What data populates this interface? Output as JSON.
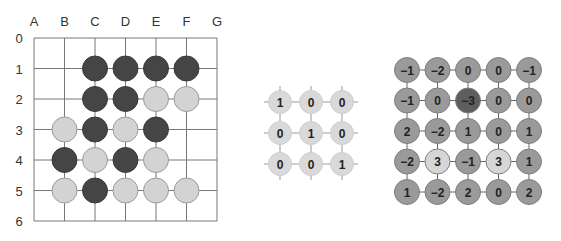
{
  "board": {
    "col_labels": [
      "A",
      "B",
      "C",
      "D",
      "E",
      "F",
      "G"
    ],
    "row_labels": [
      "0",
      "1",
      "2",
      "3",
      "4",
      "5",
      "6"
    ],
    "stones": [
      {
        "col": "C",
        "row": 1,
        "color": "black"
      },
      {
        "col": "D",
        "row": 1,
        "color": "black"
      },
      {
        "col": "E",
        "row": 1,
        "color": "black"
      },
      {
        "col": "F",
        "row": 1,
        "color": "black"
      },
      {
        "col": "C",
        "row": 2,
        "color": "black"
      },
      {
        "col": "D",
        "row": 2,
        "color": "black"
      },
      {
        "col": "E",
        "row": 2,
        "color": "white"
      },
      {
        "col": "F",
        "row": 2,
        "color": "white"
      },
      {
        "col": "B",
        "row": 3,
        "color": "white"
      },
      {
        "col": "C",
        "row": 3,
        "color": "black"
      },
      {
        "col": "D",
        "row": 3,
        "color": "white"
      },
      {
        "col": "E",
        "row": 3,
        "color": "black"
      },
      {
        "col": "B",
        "row": 4,
        "color": "black"
      },
      {
        "col": "C",
        "row": 4,
        "color": "white"
      },
      {
        "col": "D",
        "row": 4,
        "color": "black"
      },
      {
        "col": "E",
        "row": 4,
        "color": "white"
      },
      {
        "col": "B",
        "row": 5,
        "color": "white"
      },
      {
        "col": "C",
        "row": 5,
        "color": "black"
      },
      {
        "col": "D",
        "row": 5,
        "color": "white"
      },
      {
        "col": "E",
        "row": 5,
        "color": "white"
      },
      {
        "col": "F",
        "row": 5,
        "color": "white"
      }
    ]
  },
  "kernel": {
    "values": [
      [
        "1",
        "0",
        "0"
      ],
      [
        "0",
        "1",
        "0"
      ],
      [
        "0",
        "0",
        "1"
      ]
    ]
  },
  "result": {
    "values": [
      [
        "−1",
        "−2",
        "0",
        "0",
        "−1"
      ],
      [
        "−1",
        "0",
        "−3",
        "0",
        "0"
      ],
      [
        "2",
        "−2",
        "1",
        "0",
        "1"
      ],
      [
        "−2",
        "3",
        "−1",
        "3",
        "1"
      ],
      [
        "1",
        "−2",
        "2",
        "0",
        "2"
      ]
    ]
  },
  "colors": {
    "black_stone": "#454545",
    "white_stone": "#d3d3d3",
    "kernel_cell": "#d9d9d9",
    "result_cell": "#9a9a9a",
    "result_dark": "#5e5e5e",
    "result_light": "#d6d6d6"
  }
}
